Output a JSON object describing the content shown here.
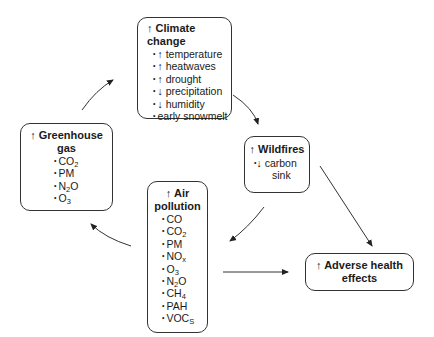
{
  "diagram": {
    "nodes": {
      "climate_change": {
        "arrow": "↑",
        "title": "Climate change",
        "items": [
          {
            "prefix": "↑",
            "text": "temperature"
          },
          {
            "prefix": "↑",
            "text": "heatwaves"
          },
          {
            "prefix": "↑",
            "text": "drought"
          },
          {
            "prefix": "↓",
            "text": "precipitation"
          },
          {
            "prefix": "↓",
            "text": "humidity"
          },
          {
            "prefix": "",
            "text": "early snowmelt"
          }
        ]
      },
      "greenhouse_gas": {
        "arrow": "↑",
        "title_line1": "Greenhouse",
        "title_line2": "gas",
        "items": [
          {
            "base": "CO",
            "sub": "2",
            "tail": ""
          },
          {
            "base": "PM",
            "sub": "",
            "tail": ""
          },
          {
            "base": "N",
            "sub": "2",
            "tail": "O"
          },
          {
            "base": "O",
            "sub": "3",
            "tail": ""
          }
        ]
      },
      "wildfires": {
        "arrow": "↑",
        "title": "Wildfires",
        "item_prefix": "↓",
        "item_line1": "carbon",
        "item_line2": "sink"
      },
      "air_pollution": {
        "arrow": "↑",
        "title_line1": "Air",
        "title_line2": "pollution",
        "items": [
          {
            "base": "CO",
            "sub": "",
            "tail": ""
          },
          {
            "base": "CO",
            "sub": "2",
            "tail": ""
          },
          {
            "base": "PM",
            "sub": "",
            "tail": ""
          },
          {
            "base": "NO",
            "sub": "x",
            "tail": ""
          },
          {
            "base": "O",
            "sub": "3",
            "tail": ""
          },
          {
            "base": "N",
            "sub": "2",
            "tail": "O"
          },
          {
            "base": "CH",
            "sub": "4",
            "tail": ""
          },
          {
            "base": "PAH",
            "sub": "",
            "tail": ""
          },
          {
            "base": "VOC",
            "sub": "S",
            "tail": ""
          }
        ]
      },
      "adverse_health": {
        "arrow": "↑",
        "title_line1": "Adverse health",
        "title_line2": "effects"
      }
    },
    "edges": [
      {
        "from": "greenhouse_gas",
        "to": "climate_change"
      },
      {
        "from": "climate_change",
        "to": "wildfires"
      },
      {
        "from": "wildfires",
        "to": "air_pollution"
      },
      {
        "from": "wildfires",
        "to": "adverse_health"
      },
      {
        "from": "air_pollution",
        "to": "adverse_health"
      },
      {
        "from": "air_pollution",
        "to": "greenhouse_gas"
      }
    ],
    "colors": {
      "stroke": "#333333",
      "text": "#1a1a1a",
      "background": "#ffffff"
    }
  }
}
